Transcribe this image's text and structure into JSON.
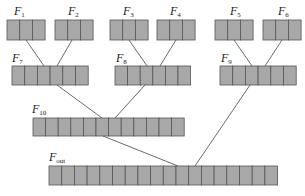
{
  "diagram": {
    "colors": {
      "cell_fill": "#a8a8a8",
      "cell_stroke": "#555555",
      "line": "#444444",
      "background": "#ffffff"
    },
    "nodes": [
      {
        "id": "F1",
        "base": "F",
        "sub": "1",
        "x": 7,
        "y": 20,
        "cells": 3,
        "cw": 12.7,
        "h": 20,
        "lx": 14,
        "ly": 5
      },
      {
        "id": "F2",
        "base": "F",
        "sub": "2",
        "x": 55,
        "y": 20,
        "cells": 3,
        "cw": 12.7,
        "h": 20,
        "lx": 68,
        "ly": 5
      },
      {
        "id": "F3",
        "base": "F",
        "sub": "3",
        "x": 110,
        "y": 20,
        "cells": 3,
        "cw": 12.7,
        "h": 20,
        "lx": 123,
        "ly": 5
      },
      {
        "id": "F4",
        "base": "F",
        "sub": "4",
        "x": 157,
        "y": 20,
        "cells": 3,
        "cw": 12.7,
        "h": 20,
        "lx": 170,
        "ly": 5
      },
      {
        "id": "F5",
        "base": "F",
        "sub": "5",
        "x": 215,
        "y": 20,
        "cells": 3,
        "cw": 12.7,
        "h": 20,
        "lx": 230,
        "ly": 5
      },
      {
        "id": "F6",
        "base": "F",
        "sub": "6",
        "x": 263,
        "y": 20,
        "cells": 3,
        "cw": 12.7,
        "h": 20,
        "lx": 278,
        "ly": 5
      },
      {
        "id": "F7",
        "base": "F",
        "sub": "7",
        "x": 12,
        "y": 66,
        "cells": 6,
        "cw": 12.7,
        "h": 19,
        "lx": 12,
        "ly": 52
      },
      {
        "id": "F8",
        "base": "F",
        "sub": "8",
        "x": 115,
        "y": 66,
        "cells": 6,
        "cw": 12.6,
        "h": 19,
        "lx": 116,
        "ly": 52
      },
      {
        "id": "F9",
        "base": "F",
        "sub": "9",
        "x": 220,
        "y": 66,
        "cells": 6,
        "cw": 12.7,
        "h": 19,
        "lx": 221,
        "ly": 52
      },
      {
        "id": "F10",
        "base": "F",
        "sub": "10",
        "x": 33,
        "y": 118,
        "cells": 12,
        "cw": 12.6,
        "h": 18,
        "lx": 32,
        "ly": 103
      },
      {
        "id": "Fout",
        "base": "F",
        "sub": "out",
        "x": 49,
        "y": 166,
        "cells": 18,
        "cw": 12.7,
        "h": 19,
        "lx": 49,
        "ly": 151
      }
    ],
    "edges": [
      {
        "from": [
          26,
          40
        ],
        "to": [
          44,
          66
        ]
      },
      {
        "from": [
          72,
          40
        ],
        "to": [
          57,
          66
        ]
      },
      {
        "from": [
          129,
          40
        ],
        "to": [
          147,
          66
        ]
      },
      {
        "from": [
          176,
          40
        ],
        "to": [
          160,
          66
        ]
      },
      {
        "from": [
          234,
          40
        ],
        "to": [
          252,
          66
        ]
      },
      {
        "from": [
          282,
          40
        ],
        "to": [
          265,
          66
        ]
      },
      {
        "from": [
          57,
          85
        ],
        "to": [
          102,
          118
        ]
      },
      {
        "from": [
          145,
          85
        ],
        "to": [
          115,
          118
        ]
      },
      {
        "from": [
          250,
          85
        ],
        "to": [
          195,
          166
        ]
      },
      {
        "from": [
          103,
          136
        ],
        "to": [
          178,
          166
        ]
      }
    ]
  }
}
